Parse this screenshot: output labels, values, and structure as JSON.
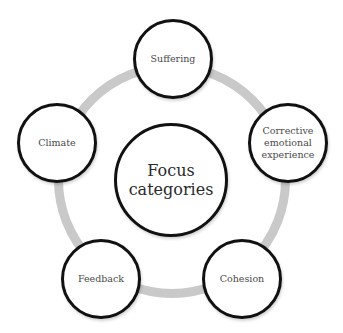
{
  "diagram": {
    "type": "radial-cycle",
    "center": {
      "label": "Focus\ncategories"
    },
    "nodes": [
      {
        "label": "Suffering"
      },
      {
        "label": "Corrective\nemotional\nexperience"
      },
      {
        "label": "Cohesion"
      },
      {
        "label": "Feedback"
      },
      {
        "label": "Climate"
      }
    ],
    "colors": {
      "ring": "#c9c9c9",
      "node_border": "#111111",
      "node_fill": "#ffffff",
      "text": "#4a4a4a"
    }
  }
}
